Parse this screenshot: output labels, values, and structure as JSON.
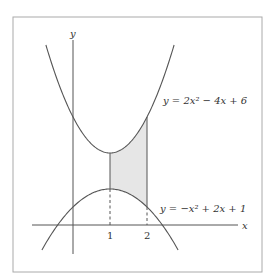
{
  "figure": {
    "axis_labels": {
      "x": "x",
      "y": "y"
    },
    "ticks": [
      {
        "value": 1,
        "label": "1"
      },
      {
        "value": 2,
        "label": "2"
      }
    ],
    "curves": [
      {
        "name": "upper",
        "equation": "y = 2x² − 4x + 6",
        "a": 2,
        "b": -4,
        "c": 6
      },
      {
        "name": "lower",
        "equation": "y = −x² + 2x + 1",
        "a": -1,
        "b": 2,
        "c": 1
      }
    ],
    "shaded_region": {
      "x_from": 1,
      "x_to": 2,
      "fill": "#e6e6e6"
    },
    "colors": {
      "stroke": "#555555",
      "frame": "#aaaaaa",
      "shade": "#e6e6e6"
    }
  }
}
